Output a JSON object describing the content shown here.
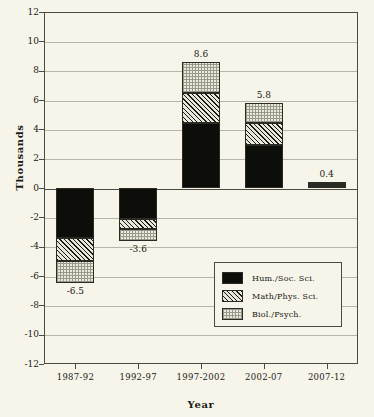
{
  "chart_data": {
    "type": "bar",
    "subtype": "stacked-bar-with-negatives",
    "title": "",
    "xlabel": "Year",
    "ylabel": "Thousands",
    "ylim": [
      -12,
      12
    ],
    "ytick_values": [
      12,
      10,
      8,
      6,
      4,
      2,
      0,
      -2,
      -4,
      -6,
      -8,
      -10,
      -12
    ],
    "ytick_labels": [
      "12",
      "10",
      "8",
      "6",
      "4",
      "2",
      "0",
      "-2",
      "-4",
      "-6",
      "-8",
      "-10",
      "-12"
    ],
    "grid": true,
    "grid_axis": "y",
    "legend_position": "lower-right-inside",
    "categories": [
      "1987-92",
      "1992-97",
      "1997-2002",
      "2002-07",
      "2007-12"
    ],
    "series": [
      {
        "name": "Hum./Soc. Sci.",
        "pattern": "solid-black",
        "values": [
          -3.4,
          -2.1,
          4.4,
          2.9,
          0.15
        ]
      },
      {
        "name": "Math/Phys. Sci.",
        "pattern": "diagonal-hatch",
        "values": [
          -1.6,
          -0.7,
          2.1,
          1.5,
          0.15
        ]
      },
      {
        "name": "Biol./Psych.",
        "pattern": "fine-dotted",
        "values": [
          -1.5,
          -0.8,
          2.1,
          1.4,
          0.1
        ]
      }
    ],
    "totals": [
      -6.5,
      -3.6,
      8.6,
      5.8,
      0.4
    ],
    "total_labels": [
      "-6.5",
      "-3.6",
      "8.6",
      "5.8",
      "0.4"
    ]
  },
  "legend": {
    "items": [
      {
        "label": "Hum./Soc. Sci.",
        "swatch": "solid-black-swatch"
      },
      {
        "label": "Math/Phys. Sci.",
        "swatch": "diagonal-hatch-swatch"
      },
      {
        "label": "Biol./Psych.",
        "swatch": "dotted-swatch"
      }
    ]
  },
  "colors": {
    "background": "#f7f5ea",
    "axis": "#4a4a42",
    "grid": "#b8b6a8",
    "hum_soc": "#0d0d0a",
    "math_phys": "#e8e6d8",
    "biol_psych": "#ebe9dc"
  }
}
